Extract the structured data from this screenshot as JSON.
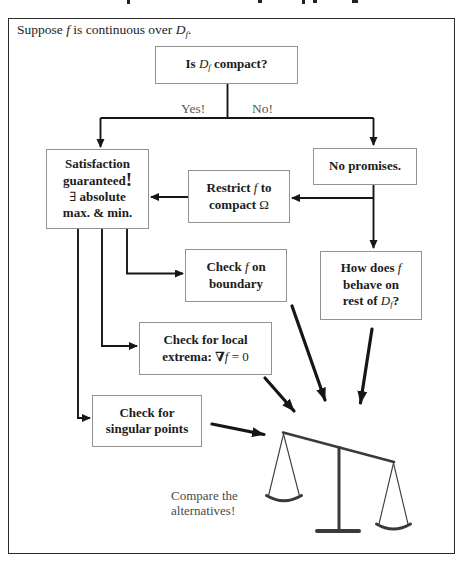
{
  "colors": {
    "line": "#161616",
    "box_border": "#929292",
    "frame_border": "#2b2b2b",
    "text": "#1c1c1c",
    "muted_label": "#575757",
    "caption_gray": "#4a4a4a"
  },
  "header": {
    "s1": "Suppose ",
    "f": "f",
    "s2": " is continuous over ",
    "D": "D",
    "Dsub": "f",
    "s3": "."
  },
  "branch": {
    "yes": "Yes!",
    "no": "No!"
  },
  "boxes": {
    "is_compact": {
      "s1": "Is ",
      "D": "D",
      "Dsub": "f",
      "s2": " compact?"
    },
    "satisfaction": {
      "l1": "Satisfaction",
      "l2": "guaranteed",
      "bang": "!",
      "exists": "∃",
      "l3": " absolute",
      "l4": "max. & min."
    },
    "no_promises": {
      "l1": "No promises."
    },
    "restrict": {
      "s1": "Restrict ",
      "f": "f",
      "s2": " to",
      "s3": "compact ",
      "omega": "Ω"
    },
    "check_boundary": {
      "s1": "Check ",
      "f": "f",
      "s2": " on",
      "l2": "boundary"
    },
    "how_behave": {
      "s1": "How does ",
      "f": "f",
      "l2": "behave on",
      "s3": "rest of ",
      "D": "D",
      "Dsub": "f",
      "s4": "?"
    },
    "local_extrema": {
      "l1": "Check for local",
      "s1": "extrema: ",
      "nabla": "∇",
      "f": "f",
      "s2": " = 0"
    },
    "singular_points": {
      "l1": "Check for",
      "l2": "singular points"
    }
  },
  "caption": {
    "l1": "Compare the",
    "l2": "alternatives!"
  },
  "icons": {
    "balance_scale": "balance-scale-icon"
  }
}
